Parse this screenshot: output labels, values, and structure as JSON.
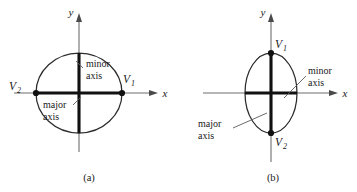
{
  "figure": {
    "caption_a": "(a)",
    "caption_b": "(b)"
  },
  "panel_a": {
    "name": "horizontal-ellipse",
    "axis_x_label": "x",
    "axis_y_label": "y",
    "vertex_left_base": "V",
    "vertex_left_sub": "2",
    "vertex_right_base": "V",
    "vertex_right_sub": "1",
    "minor_label_line1": "minor",
    "minor_label_line2": "axis",
    "major_label_line1": "major",
    "major_label_line2": "axis"
  },
  "panel_b": {
    "name": "vertical-ellipse",
    "axis_x_label": "x",
    "axis_y_label": "y",
    "vertex_top_base": "V",
    "vertex_top_sub": "1",
    "vertex_bottom_base": "V",
    "vertex_bottom_sub": "2",
    "minor_label_line1": "minor",
    "minor_label_line2": "axis",
    "major_label_line1": "major",
    "major_label_line2": "axis"
  },
  "colors": {
    "background": "#ffffff",
    "axis_gray": "#6d6d6d",
    "curve_black": "#2b2b2b",
    "emphasis_black": "#111111",
    "leader_gray": "#5a5a5a"
  }
}
